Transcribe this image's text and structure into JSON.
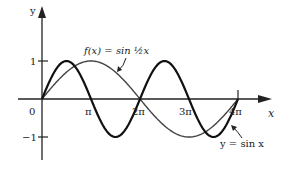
{
  "chart_data": {
    "type": "line",
    "title": "",
    "xlabel": "x",
    "ylabel": "y",
    "x_ticks": [
      "0",
      "π",
      "2π",
      "3π",
      "4π"
    ],
    "y_ticks": [
      "1",
      "−1"
    ],
    "xlim": [
      0,
      12.566
    ],
    "ylim": [
      -1,
      1
    ],
    "grid": false,
    "series": [
      {
        "name": "y = sin x",
        "function": "sin(x)",
        "style": "thick black",
        "x": [
          0,
          1.571,
          3.142,
          4.712,
          6.283,
          7.854,
          9.425,
          10.996,
          12.566
        ],
        "values": [
          0,
          1,
          0,
          -1,
          0,
          1,
          0,
          -1,
          0
        ]
      },
      {
        "name": "f(x) = sin ½x",
        "function": "sin(x/2)",
        "style": "thin dark gray",
        "x": [
          0,
          3.142,
          6.283,
          9.425,
          12.566
        ],
        "values": [
          0,
          1,
          0,
          -1,
          0
        ]
      }
    ],
    "annotations": [
      {
        "text": "f(x) = sin ½x",
        "points_to": "sin(x/2)"
      },
      {
        "text": "y = sin x",
        "points_to": "sin(x)"
      }
    ]
  },
  "labels": {
    "y_axis": "y",
    "x_axis": "x",
    "origin": "0",
    "pi": "π",
    "two_pi": "2π",
    "three_pi": "3π",
    "four_pi": "4π",
    "one": "1",
    "neg_one": "−1",
    "f_label": "f(x) = sin ½x",
    "sin_label": "y = sin x"
  }
}
